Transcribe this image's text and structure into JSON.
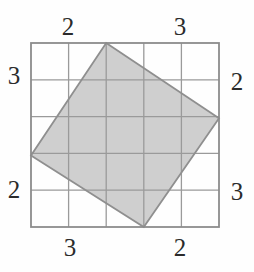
{
  "figure": {
    "background_color": "#fefefe",
    "grid": {
      "columns": 5,
      "rows": 5,
      "left": 31,
      "top": 43,
      "cell_size": 37.6,
      "line_color": "#9a9a9a",
      "border_color": "#8c8c8c",
      "line_width": 1.3,
      "border_width": 1.8
    },
    "shape": {
      "name": "tilted-square",
      "fill_color": "#cfcfcf",
      "stroke_color": "#8f8f8f",
      "stroke_width": 1.8,
      "vertices": [
        {
          "name": "top-vertex",
          "x": 106.2,
          "y": 43
        },
        {
          "name": "right-vertex",
          "x": 219,
          "y": 118.2
        },
        {
          "name": "bottom-vertex",
          "x": 143.8,
          "y": 227
        },
        {
          "name": "left-vertex",
          "x": 31,
          "y": 155.6
        }
      ],
      "vertex_grid_positions": [
        {
          "name": "top-vertex",
          "side": "top",
          "units_from_left": 2
        },
        {
          "name": "right-vertex",
          "side": "right",
          "units_from_top": 2
        },
        {
          "name": "bottom-vertex",
          "side": "bottom",
          "units_from_left": 3
        },
        {
          "name": "left-vertex",
          "side": "left",
          "units_from_top": 3
        }
      ]
    },
    "labels": [
      {
        "id": "top-left",
        "text": "2",
        "x": 68,
        "y": 27,
        "side": "top",
        "segment": "left-of-vertex"
      },
      {
        "id": "top-right",
        "text": "3",
        "x": 180,
        "y": 27,
        "side": "top",
        "segment": "right-of-vertex"
      },
      {
        "id": "left-upper",
        "text": "3",
        "x": 14,
        "y": 76,
        "side": "left",
        "segment": "above-vertex"
      },
      {
        "id": "left-lower",
        "text": "2",
        "x": 14,
        "y": 190,
        "side": "left",
        "segment": "below-vertex"
      },
      {
        "id": "right-upper",
        "text": "2",
        "x": 237,
        "y": 82,
        "side": "right",
        "segment": "above-vertex"
      },
      {
        "id": "right-lower",
        "text": "3",
        "x": 237,
        "y": 192,
        "side": "right",
        "segment": "below-vertex"
      },
      {
        "id": "bottom-left",
        "text": "3",
        "x": 70,
        "y": 248,
        "side": "bottom",
        "segment": "left-of-vertex"
      },
      {
        "id": "bottom-right",
        "text": "2",
        "x": 180,
        "y": 248,
        "side": "bottom",
        "segment": "right-of-vertex"
      }
    ]
  }
}
